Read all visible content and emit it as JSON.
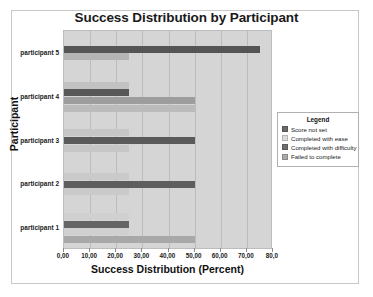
{
  "chart_data": {
    "type": "bar",
    "orientation": "horizontal",
    "title": "Success Distribution by Participant",
    "xlabel": "Success Distribution (Percent)",
    "ylabel": "Participant",
    "categories": [
      "participant 1",
      "participant 2",
      "participant 3",
      "participant 4",
      "participant 5"
    ],
    "xlim": [
      0,
      80
    ],
    "x_ticks": [
      "0,00",
      "10,00",
      "20,00",
      "30,00",
      "40,00",
      "50,00",
      "60,00",
      "70,00",
      "80,0"
    ],
    "x_tick_values": [
      0,
      10,
      20,
      30,
      40,
      50,
      60,
      70,
      80
    ],
    "grid": true,
    "grid_axis": "x",
    "legend_position": "right-middle",
    "legend_title": "Legend",
    "series": [
      {
        "name": "Score not set",
        "color": "#6b6b6b",
        "values": [
          25,
          25,
          25,
          25,
          75
        ]
      },
      {
        "name": "Completed with ease",
        "color": "#d9d9d9",
        "values": [
          25,
          25,
          25,
          25,
          25
        ]
      },
      {
        "name": "Completed with difficulty",
        "color": "#777777",
        "values": [
          25,
          25,
          25,
          50,
          0
        ]
      },
      {
        "name": "Failed to complete",
        "color": "#a8a8a8",
        "values": [
          50,
          0,
          0,
          50,
          0
        ]
      }
    ],
    "groups": [
      {
        "category": "participant 1",
        "bars": [
          {
            "series": "Completed with ease",
            "value": 25,
            "color": "#d0d0d0"
          },
          {
            "series": "Score not set",
            "value": 25,
            "color": "#656565"
          },
          {
            "series": "Completed with ease",
            "value": 25,
            "color": "#d0d0d0"
          },
          {
            "series": "Failed to complete",
            "value": 50,
            "color": "#a8a8a8"
          }
        ]
      },
      {
        "category": "participant 2",
        "bars": [
          {
            "series": "Completed with ease",
            "value": 25,
            "color": "#cacaca"
          },
          {
            "series": "Score not set",
            "value": 50,
            "color": "#5e5e5e"
          },
          {
            "series": "Completed with ease",
            "value": 25,
            "color": "#cacaca"
          }
        ]
      },
      {
        "category": "participant 3",
        "bars": [
          {
            "series": "Completed with ease",
            "value": 25,
            "color": "#c6c6c6"
          },
          {
            "series": "Score not set",
            "value": 50,
            "color": "#5a5a5a"
          },
          {
            "series": "Completed with ease",
            "value": 25,
            "color": "#c6c6c6"
          }
        ]
      },
      {
        "category": "participant 4",
        "bars": [
          {
            "series": "Completed with ease",
            "value": 25,
            "color": "#c2c2c2"
          },
          {
            "series": "Score not set",
            "value": 25,
            "color": "#585858"
          },
          {
            "series": "Completed with difficulty",
            "value": 50,
            "color": "#9d9d9d"
          },
          {
            "series": "Failed to complete",
            "value": 50,
            "color": "#bbbbbb"
          }
        ]
      },
      {
        "category": "participant 5",
        "bars": [
          {
            "series": "Score not set",
            "value": 75,
            "color": "#555555"
          },
          {
            "series": "Completed with ease",
            "value": 25,
            "color": "#b4b4b4"
          }
        ]
      }
    ]
  },
  "legend": {
    "title": "Legend",
    "items": [
      {
        "label": "Score not set",
        "color": "#6b6b6b"
      },
      {
        "label": "Completed with ease",
        "color": "#dcdcdc"
      },
      {
        "label": "Completed with difficulty",
        "color": "#6f6f6f"
      },
      {
        "label": "Failed to complete",
        "color": "#a9a9a9"
      }
    ]
  },
  "colors": {
    "plot_background": "#d5d5d5",
    "gridline": "#bcbcbc",
    "frame": "#c8c8c8",
    "text": "#1a1a1a"
  }
}
